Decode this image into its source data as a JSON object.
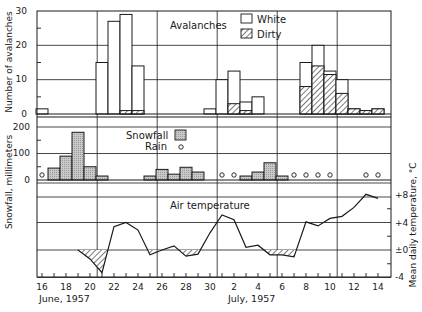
{
  "chart_data": [
    {
      "type": "bar",
      "stacked": true,
      "panel": "avalanches",
      "title": "Avalanches",
      "ylabel": "Number of avalanches",
      "ylim": [
        0,
        30
      ],
      "yticks": [
        "0",
        "10",
        "20",
        "30"
      ],
      "legend": [
        {
          "name": "White",
          "pattern": "open"
        },
        {
          "name": "Dirty",
          "pattern": "hatched"
        }
      ],
      "categories": [
        "Jun 16",
        "Jun 21",
        "Jun 22",
        "Jun 23",
        "Jun 24",
        "Jun 30",
        "Jul 1",
        "Jul 2",
        "Jul 3",
        "Jul 4",
        "Jul 8",
        "Jul 9",
        "Jul 10",
        "Jul 11",
        "Jul 12",
        "Jul 13",
        "Jul 14"
      ],
      "days": [
        16,
        21,
        22,
        23,
        24,
        30,
        31,
        32,
        33,
        34,
        38,
        39,
        40,
        41,
        42,
        43,
        44
      ],
      "series": [
        {
          "name": "White",
          "values": [
            1.5,
            15,
            27,
            28,
            13,
            1.5,
            10,
            9.5,
            2.5,
            5,
            7,
            6,
            1,
            4,
            0,
            0,
            0
          ]
        },
        {
          "name": "Dirty",
          "values": [
            0,
            0,
            0,
            1,
            1,
            0,
            0,
            3,
            1,
            0,
            8,
            14,
            11.5,
            6,
            1.5,
            1,
            1.5
          ]
        }
      ]
    },
    {
      "type": "bar",
      "panel": "snowfall",
      "ylabel": "Snowfall, millimeters",
      "ylim": [
        0,
        200
      ],
      "yticks": [
        "0",
        "100",
        "200"
      ],
      "legend": [
        {
          "name": "Snowfall",
          "pattern": "stippled"
        },
        {
          "name": "Rain",
          "pattern": "circle"
        }
      ],
      "snowfall": {
        "days": [
          17,
          18,
          19,
          20,
          21,
          25,
          26,
          27,
          28,
          29,
          33,
          34,
          35,
          36
        ],
        "labels": [
          "Jun 17",
          "Jun 18",
          "Jun 19",
          "Jun 20",
          "Jun 21",
          "Jun 25",
          "Jun 26",
          "Jun 27",
          "Jun 28",
          "Jun 29",
          "Jul 3",
          "Jul 4",
          "Jul 5",
          "Jul 6"
        ],
        "values": [
          45,
          90,
          180,
          50,
          15,
          15,
          40,
          22,
          48,
          30,
          15,
          30,
          65,
          15
        ]
      },
      "rain_days": {
        "days": [
          16,
          31,
          32,
          37,
          38,
          39,
          40,
          43,
          44
        ],
        "labels": [
          "Jun 16",
          "Jul 1",
          "Jul 2",
          "Jul 7",
          "Jul 8",
          "Jul 9",
          "Jul 10",
          "Jul 13",
          "Jul 14"
        ]
      }
    },
    {
      "type": "line",
      "panel": "temperature",
      "title": "Air temperature",
      "ylabel": "Mean daily temperature, °C",
      "ylim": [
        -4,
        8
      ],
      "yticks": [
        "-4",
        "±0",
        "+4",
        "+8"
      ],
      "shade_below_zero": true,
      "x": [
        19,
        20,
        21,
        22,
        23,
        24,
        25,
        26,
        27,
        28,
        29,
        30,
        31,
        32,
        33,
        34,
        35,
        36,
        37,
        38,
        39,
        40,
        41,
        42,
        43,
        44
      ],
      "values": [
        0,
        -1.3,
        -3.3,
        3.4,
        4.0,
        2.9,
        -0.7,
        0,
        0.6,
        -0.9,
        -0.6,
        2.5,
        5.1,
        4.4,
        0.4,
        0.7,
        -0.7,
        -0.7,
        -1.0,
        4.1,
        3.5,
        4.6,
        4.9,
        6.2,
        8.1,
        7.5
      ]
    }
  ],
  "axes": {
    "x_ticks": [
      "16",
      "18",
      "20",
      "22",
      "24",
      "26",
      "28",
      "30",
      "2",
      "4",
      "6",
      "8",
      "10",
      "12",
      "14"
    ],
    "x_tick_days": [
      16,
      18,
      20,
      22,
      24,
      26,
      28,
      30,
      32,
      34,
      36,
      38,
      40,
      42,
      44
    ],
    "month_labels": [
      "June, 1957",
      "July, 1957"
    ],
    "y_left_avalanche_label": "Number of avalanches",
    "y_left_snow_label": "Snowfall, millimeters",
    "y_right_temp_label": "Mean daily temperature, °C"
  },
  "labels": {
    "avalanches_title": "Avalanches",
    "legend_white": "White",
    "legend_dirty": "Dirty",
    "legend_snowfall": "Snowfall",
    "legend_rain": "Rain",
    "temp_title": "Air temperature"
  }
}
